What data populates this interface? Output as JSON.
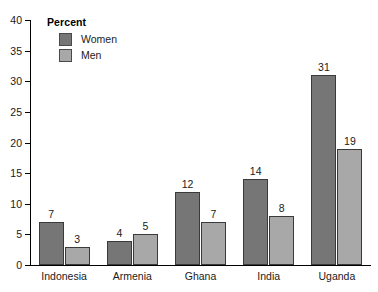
{
  "chart_data": {
    "type": "bar",
    "title": "",
    "xlabel": "",
    "ylabel": "Percent",
    "ylim": [
      0,
      40
    ],
    "yticks": [
      0,
      5,
      10,
      15,
      20,
      25,
      30,
      35,
      40
    ],
    "ytick_labels": [
      "0",
      "5",
      "10",
      "15",
      "20",
      "25",
      "30",
      "35",
      "40"
    ],
    "grid": false,
    "legend_position": "top-left",
    "legend_title": "Percent",
    "categories": [
      "Indonesia",
      "Armenia",
      "Ghana",
      "India",
      "Uganda"
    ],
    "series": [
      {
        "name": "Women",
        "color": "#767676",
        "values": [
          7,
          4,
          12,
          14,
          31
        ],
        "value_labels": [
          "7",
          "4",
          "12",
          "14",
          "31"
        ]
      },
      {
        "name": "Men",
        "color": "#a8a8a8",
        "values": [
          3,
          5,
          7,
          8,
          19
        ],
        "value_labels": [
          "3",
          "5",
          "7",
          "8",
          "19"
        ]
      }
    ]
  },
  "legend": {
    "title": "Percent",
    "entries": [
      {
        "label": "Women",
        "color": "#767676"
      },
      {
        "label": "Men",
        "color": "#a8a8a8"
      }
    ]
  },
  "colors": {
    "women_bar": "#767676",
    "men_bar": "#a8a8a8",
    "axis": "#000000",
    "text": "#1a1a1a",
    "background": "#ffffff"
  }
}
